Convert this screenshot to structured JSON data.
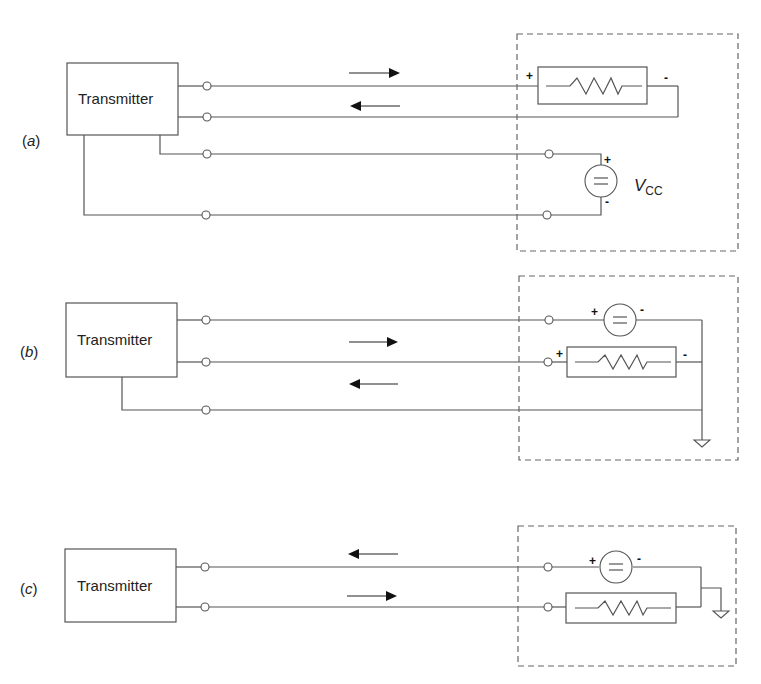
{
  "figure": {
    "panels": [
      {
        "id": "a",
        "label_prefix": "(",
        "label_letter": "a",
        "label_suffix": ")",
        "transmitter_label": "Transmitter",
        "wires": 4,
        "arrows": [
          "right",
          "left"
        ],
        "resistor_plus": "+",
        "resistor_minus": "-",
        "source_plus": "+",
        "source_minus": "-",
        "source_label_main": "V",
        "source_label_sub": "CC"
      },
      {
        "id": "b",
        "label_prefix": "(",
        "label_letter": "b",
        "label_suffix": ")",
        "transmitter_label": "Transmitter",
        "wires": 3,
        "arrows": [
          "right",
          "left"
        ],
        "source_plus": "+",
        "source_minus": "-",
        "resistor_plus": "+",
        "resistor_minus": "-",
        "ground": "ground-symbol"
      },
      {
        "id": "c",
        "label_prefix": "(",
        "label_letter": "c",
        "label_suffix": ")",
        "transmitter_label": "Transmitter",
        "wires": 2,
        "arrows": [
          "left",
          "right"
        ],
        "source_plus": "+",
        "source_minus": "-",
        "ground": "ground-symbol"
      }
    ],
    "colors": {
      "line": "#555555",
      "text": "#222222",
      "background": "#ffffff",
      "dashed_border": "#666666"
    }
  }
}
